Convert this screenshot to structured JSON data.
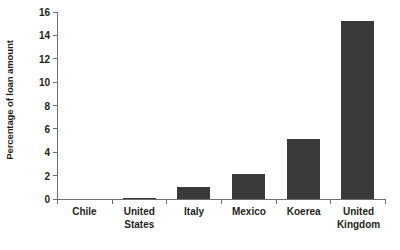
{
  "chart_data": {
    "type": "bar",
    "title": "",
    "subtitle": "",
    "xlabel": "",
    "ylabel": "Percentage of loan amount",
    "categories": [
      "Chile",
      "United States",
      "Italy",
      "Mexico",
      "Koerea",
      "United Kingdom"
    ],
    "values": [
      0,
      0.1,
      1.0,
      2.1,
      5.1,
      15.2
    ],
    "series": [
      {
        "name": "Percentage of loan amount",
        "values": [
          0,
          0.1,
          1.0,
          2.1,
          5.1,
          15.2
        ]
      }
    ],
    "ylim": [
      0,
      16
    ],
    "yticks": [
      0,
      2,
      4,
      6,
      8,
      10,
      12,
      14,
      16
    ],
    "ytick_labels": [
      "0",
      "2",
      "4",
      "6",
      "8",
      "10",
      "12",
      "14",
      "16"
    ],
    "grid": false,
    "legend": false,
    "legend_position": "none",
    "bar_color": "#3a3a3a",
    "background_color": "#ffffff",
    "axis_color": "#6d6e71",
    "text_color": "#231f20",
    "annotations": []
  }
}
